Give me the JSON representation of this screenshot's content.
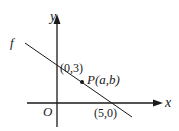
{
  "diagram": {
    "axes": {
      "x_label": "x",
      "y_label": "y",
      "origin_label": "O"
    },
    "line": {
      "name": "f",
      "label": "f"
    },
    "points": {
      "y_intercept": {
        "label": "(0,3)"
      },
      "x_intercept": {
        "label": "(5,0)"
      },
      "point_p": {
        "name": "P",
        "label_name": "P",
        "label_args": "(a,b)",
        "a": "a",
        "b": "b"
      }
    },
    "colors": {
      "stroke": "#1a1a1a",
      "background": "#ffffff"
    }
  }
}
